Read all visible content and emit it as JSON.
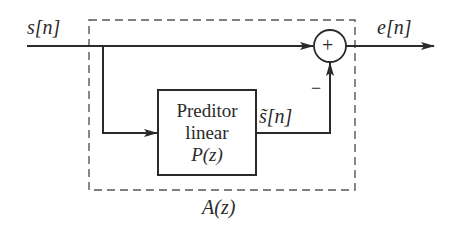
{
  "diagram": {
    "input_label": "s[n]",
    "output_label": "e[n]",
    "predicted_label": "s̃[n]",
    "sum_sign": "+",
    "minus_sign": "−",
    "predictor_block": {
      "line1": "Preditor",
      "line2": "linear",
      "line3": "P(z)"
    },
    "system_label": "A(z)",
    "colors": {
      "stroke": "#2a2a2a",
      "dashed": "#555555",
      "background": "#ffffff"
    }
  }
}
